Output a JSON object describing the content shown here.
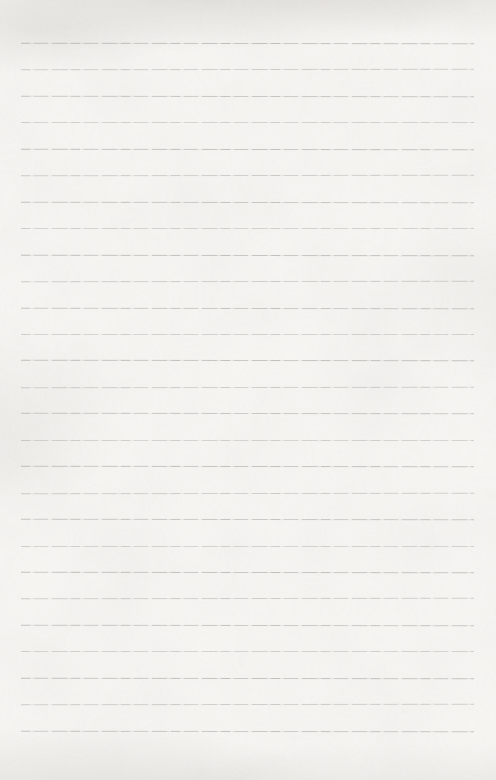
{
  "document": {
    "type": "blank-ruled-notebook-page",
    "text_content": "",
    "ruling": {
      "line_count": 27,
      "first_line_y": 43,
      "line_spacing": 26.45,
      "line_left": 21,
      "line_right_inset": 22,
      "line_color": "#8a8781"
    },
    "paper": {
      "base_color": "#f7f6f3",
      "shading_color": "#cbc8c2",
      "texture": "mottled-scan-grain"
    }
  }
}
